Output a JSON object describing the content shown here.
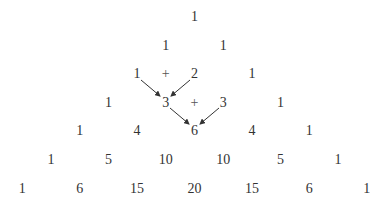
{
  "diagram": {
    "rows": [
      [
        "1"
      ],
      [
        "1",
        "1"
      ],
      [
        "1",
        "2",
        "1"
      ],
      [
        "1",
        "3",
        "3",
        "1"
      ],
      [
        "1",
        "4",
        "6",
        "4",
        "1"
      ],
      [
        "1",
        "5",
        "10",
        "10",
        "5",
        "1"
      ],
      [
        "1",
        "6",
        "15",
        "20",
        "15",
        "6",
        "1"
      ]
    ],
    "operators": [
      {
        "symbol": "+",
        "row": 2,
        "between": [
          0,
          1
        ]
      },
      {
        "symbol": "+",
        "row": 3,
        "between": [
          1,
          2
        ]
      }
    ],
    "arrows": [
      {
        "from": [
          2,
          0
        ],
        "to": [
          3,
          1
        ]
      },
      {
        "from": [
          2,
          1
        ],
        "to": [
          3,
          1
        ]
      },
      {
        "from": [
          3,
          1
        ],
        "to": [
          4,
          2
        ]
      },
      {
        "from": [
          3,
          2
        ],
        "to": [
          4,
          2
        ]
      }
    ]
  }
}
